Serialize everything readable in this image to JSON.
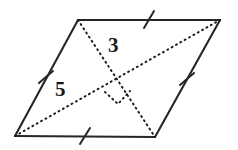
{
  "figure": {
    "kind": "geometry-diagram",
    "shape_name": "parallelogram",
    "canvas": {
      "width": 238,
      "height": 150,
      "background": "#ffffff"
    },
    "styles": {
      "edge_color": "#262626",
      "edge_width": 2.1,
      "diagonal_color": "#1f1f1f",
      "diagonal_width": 2.0,
      "diagonal_dash": "1 4",
      "tick_color": "#262626",
      "tick_width": 2.0,
      "right_angle_color": "#1f1f1f",
      "label_color": "#1a1a1a"
    },
    "vertices": [
      {
        "name": "top-left",
        "x": 78,
        "y": 20
      },
      {
        "name": "top-right",
        "x": 220,
        "y": 20
      },
      {
        "name": "bottom-right",
        "x": 155,
        "y": 137
      },
      {
        "name": "bottom-left",
        "x": 15,
        "y": 136
      }
    ],
    "edges": [
      {
        "name": "top-edge",
        "from": "top-left",
        "to": "top-right",
        "x1": 78,
        "y1": 20,
        "x2": 220,
        "y2": 20,
        "tick_count": 1
      },
      {
        "name": "right-edge",
        "from": "top-right",
        "to": "bottom-right",
        "x1": 220,
        "y1": 20,
        "x2": 155,
        "y2": 137,
        "tick_count": 1
      },
      {
        "name": "bottom-edge",
        "from": "bottom-right",
        "to": "bottom-left",
        "x1": 155,
        "y1": 137,
        "x2": 15,
        "y2": 136,
        "tick_count": 1
      },
      {
        "name": "left-edge",
        "from": "bottom-left",
        "to": "top-left",
        "x1": 15,
        "y1": 136,
        "x2": 78,
        "y2": 20,
        "tick_count": 1
      }
    ],
    "tick_marks": [
      {
        "name": "tick-top",
        "cx": 149,
        "cy": 20,
        "angle_deg": 62
      },
      {
        "name": "tick-right",
        "cx": 187,
        "cy": 79,
        "angle_deg": 28
      },
      {
        "name": "tick-bottom",
        "cx": 85,
        "cy": 136,
        "angle_deg": 62
      },
      {
        "name": "tick-left",
        "cx": 46,
        "cy": 77,
        "angle_deg": 28
      }
    ],
    "diagonals": [
      {
        "name": "diagonal-tl-br",
        "from": "top-left",
        "to": "bottom-right",
        "x1": 78,
        "y1": 20,
        "x2": 155,
        "y2": 137,
        "style": "dotted"
      },
      {
        "name": "diagonal-bl-tr",
        "from": "bottom-left",
        "to": "top-right",
        "x1": 15,
        "y1": 136,
        "x2": 220,
        "y2": 20,
        "style": "dotted"
      }
    ],
    "intersection": {
      "name": "diagonal-intersection",
      "x": 117,
      "y": 79
    },
    "right_angle_marker": {
      "name": "right-angle-marker",
      "style": "dotted",
      "size": 17,
      "points": "117,79 105,92 118,104 130,91"
    },
    "labels": [
      {
        "name": "diagonal-length-label",
        "text": "3",
        "x": 115,
        "y": 47,
        "describes": "diagonal-tl-br"
      },
      {
        "name": "side-length-label",
        "text": "5",
        "x": 62,
        "y": 91,
        "describes": "left-edge"
      }
    ]
  }
}
